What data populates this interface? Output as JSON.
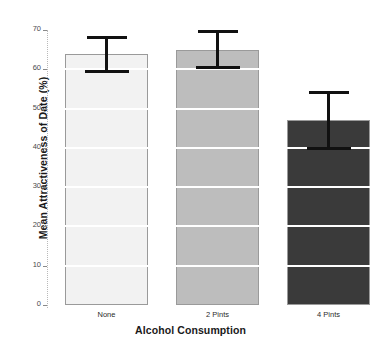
{
  "chart_data": {
    "type": "bar",
    "title": "",
    "xlabel": "Alcohol Consumption",
    "ylabel": "Mean Attractiveness of Date (%)",
    "categories": [
      "None",
      "2 Pints",
      "4 Pints"
    ],
    "values": [
      64,
      65,
      47
    ],
    "errors_low": [
      59,
      60,
      39.5
    ],
    "errors_high": [
      68.5,
      70,
      54.5
    ],
    "bar_colors": [
      "#f2f2f2",
      "#bdbdbd",
      "#3a3a3a"
    ],
    "bar_border_color": "#9a9a9a",
    "errorbar_color": "#111111",
    "ylim": [
      0,
      70
    ],
    "yticks": [
      0,
      10,
      20,
      30,
      40,
      50,
      60,
      70
    ],
    "ytick_labels": [
      "0",
      "10",
      "20",
      "30",
      "40",
      "50",
      "60",
      "70"
    ],
    "grid": true,
    "gridline_color": "#ffffff",
    "legend": null,
    "legend_position": "none",
    "axis_line_color": "#b9b9b9",
    "background": "#ffffff"
  }
}
